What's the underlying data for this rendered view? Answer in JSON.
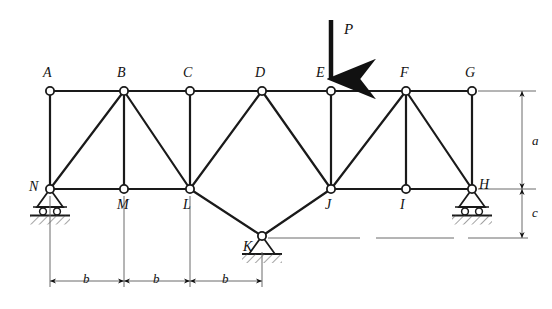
{
  "figure": {
    "type": "truss-structural-diagram",
    "stroke_color": "#1a1a1a",
    "thin_color": "#6b6b6b",
    "joint_fill": "#ffffff"
  },
  "load": {
    "label": "P",
    "applied_at_joint": "E",
    "direction": "down",
    "label_x": 344,
    "label_y": 22,
    "arrow_x": 331,
    "arrow_top_y": 20,
    "arrow_tip_y": 89
  },
  "joints": [
    {
      "id": "A",
      "x": 50,
      "y": 91,
      "label_x": 43,
      "label_y": 66,
      "chord": "top"
    },
    {
      "id": "B",
      "x": 124,
      "y": 91,
      "label_x": 117,
      "label_y": 66,
      "chord": "top"
    },
    {
      "id": "C",
      "x": 190,
      "y": 91,
      "label_x": 183,
      "label_y": 66,
      "chord": "top"
    },
    {
      "id": "D",
      "x": 262,
      "y": 91,
      "label_x": 255,
      "label_y": 66,
      "chord": "top"
    },
    {
      "id": "E",
      "x": 331,
      "y": 91,
      "label_x": 316,
      "label_y": 66,
      "chord": "top"
    },
    {
      "id": "F",
      "x": 406,
      "y": 91,
      "label_x": 400,
      "label_y": 66,
      "chord": "top"
    },
    {
      "id": "G",
      "x": 472,
      "y": 91,
      "label_x": 465,
      "label_y": 66,
      "chord": "top"
    },
    {
      "id": "H",
      "x": 472,
      "y": 189,
      "label_x": 479,
      "label_y": 178,
      "chord": "bottom"
    },
    {
      "id": "I",
      "x": 406,
      "y": 189,
      "label_x": 400,
      "label_y": 198,
      "chord": "bottom"
    },
    {
      "id": "J",
      "x": 331,
      "y": 189,
      "label_x": 325,
      "label_y": 198,
      "chord": "bottom"
    },
    {
      "id": "K",
      "x": 262,
      "y": 236,
      "label_x": 243,
      "label_y": 240,
      "chord": "apex-bottom"
    },
    {
      "id": "L",
      "x": 190,
      "y": 189,
      "label_x": 183,
      "label_y": 198,
      "chord": "bottom"
    },
    {
      "id": "M",
      "x": 124,
      "y": 189,
      "label_x": 117,
      "label_y": 198,
      "chord": "bottom"
    },
    {
      "id": "N",
      "x": 50,
      "y": 189,
      "label_x": 29,
      "label_y": 180,
      "chord": "bottom"
    }
  ],
  "members": [
    {
      "from": "A",
      "to": "B",
      "group": "top-chord"
    },
    {
      "from": "B",
      "to": "C",
      "group": "top-chord"
    },
    {
      "from": "C",
      "to": "D",
      "group": "top-chord"
    },
    {
      "from": "D",
      "to": "E",
      "group": "top-chord"
    },
    {
      "from": "E",
      "to": "F",
      "group": "top-chord"
    },
    {
      "from": "F",
      "to": "G",
      "group": "top-chord"
    },
    {
      "from": "N",
      "to": "M",
      "group": "bottom-chord"
    },
    {
      "from": "M",
      "to": "L",
      "group": "bottom-chord"
    },
    {
      "from": "J",
      "to": "I",
      "group": "bottom-chord"
    },
    {
      "from": "I",
      "to": "H",
      "group": "bottom-chord"
    },
    {
      "from": "A",
      "to": "N",
      "group": "vertical"
    },
    {
      "from": "B",
      "to": "M",
      "group": "vertical"
    },
    {
      "from": "C",
      "to": "L",
      "group": "vertical"
    },
    {
      "from": "E",
      "to": "J",
      "group": "vertical"
    },
    {
      "from": "F",
      "to": "I",
      "group": "vertical"
    },
    {
      "from": "G",
      "to": "H",
      "group": "vertical"
    },
    {
      "from": "N",
      "to": "B",
      "group": "diagonal"
    },
    {
      "from": "B",
      "to": "L",
      "group": "diagonal"
    },
    {
      "from": "L",
      "to": "D",
      "group": "diagonal"
    },
    {
      "from": "D",
      "to": "J",
      "group": "diagonal"
    },
    {
      "from": "J",
      "to": "F",
      "group": "diagonal"
    },
    {
      "from": "F",
      "to": "H",
      "group": "diagonal"
    },
    {
      "from": "L",
      "to": "K",
      "group": "diagonal"
    },
    {
      "from": "K",
      "to": "J",
      "group": "diagonal"
    }
  ],
  "supports": [
    {
      "at_joint": "N",
      "kind": "roller",
      "x": 50,
      "y": 189
    },
    {
      "at_joint": "H",
      "kind": "roller",
      "x": 472,
      "y": 189
    },
    {
      "at_joint": "K",
      "kind": "pin",
      "x": 262,
      "y": 236
    }
  ],
  "dimensions": {
    "horizontal": [
      {
        "label": "b",
        "from_x": 50,
        "to_x": 124,
        "label_x": 83,
        "label_y": 272
      },
      {
        "label": "b",
        "from_x": 124,
        "to_x": 190,
        "label_x": 153,
        "label_y": 272
      },
      {
        "label": "b",
        "from_x": 190,
        "to_x": 262,
        "label_x": 222,
        "label_y": 272
      }
    ],
    "horizontal_line_y": 281,
    "vertical": [
      {
        "label": "a",
        "from_y": 91,
        "to_y": 189,
        "label_x": 532,
        "label_y": 134
      },
      {
        "label": "c",
        "from_y": 189,
        "to_y": 238,
        "label_x": 532,
        "label_y": 206
      }
    ],
    "vertical_line_x": 522
  }
}
